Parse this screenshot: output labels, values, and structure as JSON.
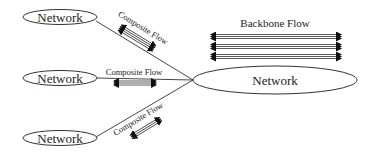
{
  "diagram": {
    "title": "",
    "nodes": [
      {
        "id": "net-top",
        "label": "Network",
        "shape": "ellipse"
      },
      {
        "id": "net-mid",
        "label": "Network",
        "shape": "ellipse"
      },
      {
        "id": "net-bottom",
        "label": "Network",
        "shape": "ellipse"
      },
      {
        "id": "net-core",
        "label": "Network",
        "shape": "ellipse"
      }
    ],
    "edges": [
      {
        "from": "net-top",
        "to": "net-core",
        "label": "Composite Flow"
      },
      {
        "from": "net-mid",
        "to": "net-core",
        "label": "Composite Flow"
      },
      {
        "from": "net-bottom",
        "to": "net-core",
        "label": "Composite Flow"
      }
    ],
    "backbone": {
      "label": "Backbone Flow",
      "bundles": 3
    }
  },
  "colors": {
    "stroke": "#333333",
    "arrow": "#111111",
    "background": "#ffffff"
  }
}
